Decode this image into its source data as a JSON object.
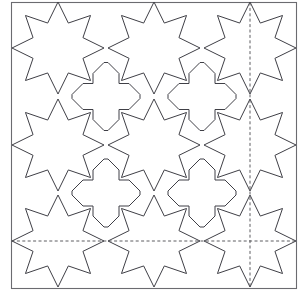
{
  "figure": {
    "canvas": {
      "width": 305,
      "height": 303
    },
    "background_color": "#ffffff"
  },
  "style": {
    "pattern_stroke_color": "#3f3f46",
    "frame_stroke_color": "#6b6b70",
    "axis_stroke_color": "#4a4a4f",
    "pattern_stroke_width": 1,
    "frame_stroke_width": 1.1,
    "axis_stroke_width": 0.9,
    "axis_dash": "3 2.4"
  },
  "frame": {
    "label": "outer-square-border",
    "x": 11.5,
    "y": 2.5,
    "width": 285,
    "height": 286
  },
  "grid": {
    "label": "star-lattice",
    "centers_x": [
      58,
      154,
      250
    ],
    "centers_y": [
      48,
      145,
      241
    ],
    "spacing_x": 96,
    "spacing_y": 96.5,
    "rows": 3,
    "columns": 3
  },
  "star_motif": {
    "label": "eight-pointed-star",
    "points": 8,
    "outer_radius": 46,
    "inner_radius": 27,
    "rotation_degrees": 0,
    "count": 9
  },
  "cross_motif": {
    "label": "cross-plus-motif",
    "arm_half_width": 13,
    "arm_length": 34,
    "notch": 11,
    "count": 4
  },
  "axes": [
    {
      "label": "vertical-mirror-axis",
      "orientation": "vertical",
      "position": 250
    },
    {
      "label": "horizontal-mirror-axis",
      "orientation": "horizontal",
      "position": 241
    }
  ]
}
